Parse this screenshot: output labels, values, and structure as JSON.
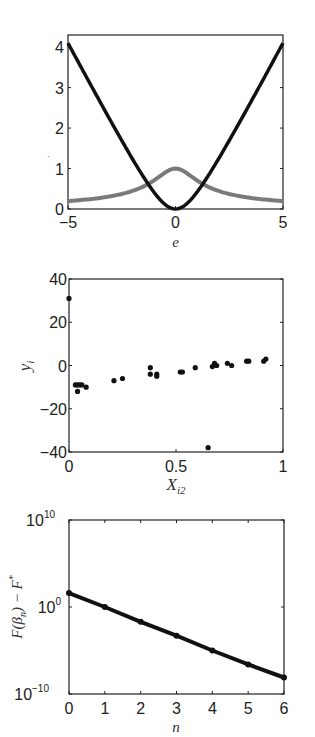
{
  "chart_data": [
    {
      "type": "line",
      "title": "",
      "xlabel": "e",
      "ylabel": "",
      "xlim": [
        -5,
        5
      ],
      "ylim": [
        0,
        4.3
      ],
      "xticks": [
        "-5",
        "0",
        "5"
      ],
      "yticks": [
        "0",
        "1",
        "2",
        "3",
        "4"
      ],
      "grid": false,
      "legend": null,
      "series": [
        {
          "name": "loss (black)",
          "color": "#111111",
          "x": [
            -5,
            -4,
            -3,
            -2,
            -1.5,
            -1,
            -0.5,
            0,
            0.5,
            1,
            1.5,
            2,
            3,
            4,
            5
          ],
          "values": [
            4.1,
            3.12,
            2.16,
            1.24,
            0.8,
            0.41,
            0.12,
            0,
            0.12,
            0.41,
            0.8,
            1.24,
            2.16,
            3.12,
            4.1
          ]
        },
        {
          "name": "weight (gray)",
          "color": "#777777",
          "x": [
            -5,
            -4,
            -3,
            -2,
            -1.5,
            -1,
            -0.5,
            0,
            0.5,
            1,
            1.5,
            2,
            3,
            4,
            5
          ],
          "values": [
            0.2,
            0.24,
            0.32,
            0.45,
            0.55,
            0.71,
            0.89,
            1.0,
            0.89,
            0.71,
            0.55,
            0.45,
            0.32,
            0.24,
            0.2
          ]
        }
      ]
    },
    {
      "type": "scatter",
      "title": "",
      "xlabel": "X_i2",
      "ylabel": "y_i",
      "xlim": [
        0,
        1
      ],
      "ylim": [
        -40,
        40
      ],
      "xticks": [
        "0",
        "0.5",
        "1"
      ],
      "yticks": [
        "-40",
        "-20",
        "0",
        "20",
        "40"
      ],
      "grid": false,
      "legend": null,
      "series": [
        {
          "name": "data",
          "color": "#111111",
          "points": [
            [
              0.0,
              31
            ],
            [
              0.03,
              -9
            ],
            [
              0.04,
              -9
            ],
            [
              0.05,
              -9
            ],
            [
              0.06,
              -9
            ],
            [
              0.04,
              -12
            ],
            [
              0.08,
              -10
            ],
            [
              0.21,
              -7
            ],
            [
              0.25,
              -6
            ],
            [
              0.38,
              -1
            ],
            [
              0.38,
              -4
            ],
            [
              0.41,
              -4
            ],
            [
              0.41,
              -5
            ],
            [
              0.52,
              -3
            ],
            [
              0.53,
              -3
            ],
            [
              0.59,
              -1
            ],
            [
              0.67,
              -0.5
            ],
            [
              0.68,
              1
            ],
            [
              0.69,
              0
            ],
            [
              0.74,
              1
            ],
            [
              0.76,
              0
            ],
            [
              0.83,
              2
            ],
            [
              0.84,
              2
            ],
            [
              0.91,
              2
            ],
            [
              0.92,
              3
            ],
            [
              0.65,
              -38
            ]
          ]
        }
      ]
    },
    {
      "type": "line",
      "title": "",
      "xlabel": "n",
      "ylabel": "F(β_n) − F*",
      "yscale": "log",
      "xlim": [
        0,
        6
      ],
      "ylim": [
        1e-10,
        10000000000.0
      ],
      "xticks": [
        "0",
        "1",
        "2",
        "3",
        "4",
        "5",
        "6"
      ],
      "yticks": [
        "10^-10",
        "10^0",
        "10^10"
      ],
      "grid": false,
      "legend": null,
      "series": [
        {
          "name": "F(β_n) − F*",
          "color": "#111111",
          "x": [
            0,
            1,
            2,
            3,
            4,
            5,
            6
          ],
          "log10_values": [
            1.6,
            0.0,
            -1.7,
            -3.3,
            -5.0,
            -6.6,
            -8.1
          ]
        }
      ]
    }
  ],
  "labels": {
    "p1": {
      "xlabel": "e",
      "xticks": [
        "−5",
        "0",
        "5"
      ],
      "yticks": [
        "0",
        "1",
        "2",
        "3",
        "4"
      ]
    },
    "p2": {
      "xlabel_base": "X",
      "xlabel_sub": "i2",
      "ylabel_base": "y",
      "ylabel_sub": "i",
      "xticks": [
        "0",
        "0.5",
        "1"
      ],
      "yticks": [
        "40",
        "20",
        "0",
        "−20",
        "−40"
      ]
    },
    "p3": {
      "xlabel": "n",
      "ylabel_a": "F(β",
      "ylabel_sub": "n",
      "ylabel_b": ") − F",
      "ylabel_sup": "*",
      "xticks": [
        "0",
        "1",
        "2",
        "3",
        "4",
        "5",
        "6"
      ],
      "ytick_base": "10",
      "ytick_exps": [
        "10",
        "0",
        "−10"
      ]
    }
  }
}
